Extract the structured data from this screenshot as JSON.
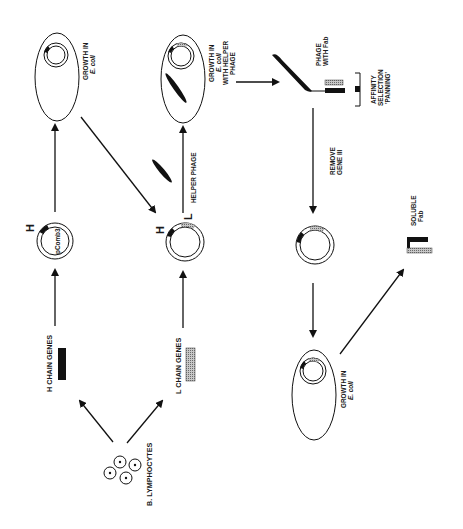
{
  "diagram": {
    "orientation": "rotated 90 degrees clockwise",
    "colors": {
      "ink": "#111111",
      "hatched": "#9a9a9a",
      "background": "#ffffff"
    },
    "labels": {
      "b_lymphocytes": "B. LYMPHOCYTES",
      "h_chain_genes": "H CHAIN GENES",
      "l_chain_genes": "L CHAIN GENES",
      "pcomb3": "pComb3",
      "h_marker_1": "H",
      "h_marker_2": "H",
      "l_marker": "L",
      "helper_phage": "HELPER PHAGE",
      "growth_ecoli_1_line1": "GROWTH IN",
      "growth_ecoli_1_line2": "E. coli",
      "growth_helper_line1": "GROWTH IN",
      "growth_helper_line2": "E. coli",
      "growth_helper_line3": "WITH HELPER",
      "growth_helper_line4": "PHAGE",
      "phage_with_fab_line1": "PHAGE",
      "phage_with_fab_line2": "WITH Fab",
      "affinity_line1": "AFFINITY",
      "affinity_line2": "SELECTION",
      "affinity_line3": "'PANNING'",
      "remove_gene_line1": "REMOVE",
      "remove_gene_line2": "GENE III",
      "growth_ecoli_2_line1": "GROWTH IN",
      "growth_ecoli_2_line2": "E. coli",
      "soluble_fab_line1": "SOLUBLE",
      "soluble_fab_line2": "Fab"
    },
    "nodes": [
      {
        "id": "b-lymphocytes",
        "label": "B. LYMPHOCYTES"
      },
      {
        "id": "h-chain-genes",
        "label": "H CHAIN GENES"
      },
      {
        "id": "l-chain-genes",
        "label": "L CHAIN GENES"
      },
      {
        "id": "pcomb3-h",
        "label": "pComb3 with H"
      },
      {
        "id": "ecoli-growth-1",
        "label": "GROWTH IN E. coli"
      },
      {
        "id": "pcomb3-hl",
        "label": "pComb3 with H and L"
      },
      {
        "id": "ecoli-helper",
        "label": "GROWTH IN E. coli WITH HELPER PHAGE"
      },
      {
        "id": "phage-fab",
        "label": "PHAGE WITH Fab"
      },
      {
        "id": "panning",
        "label": "AFFINITY SELECTION 'PANNING'"
      },
      {
        "id": "plasmid-no-geneIII",
        "label": "REMOVE GENE III"
      },
      {
        "id": "ecoli-growth-2",
        "label": "GROWTH IN E. coli"
      },
      {
        "id": "soluble-fab",
        "label": "SOLUBLE Fab"
      }
    ],
    "edges": [
      {
        "from": "b-lymphocytes",
        "to": "h-chain-genes"
      },
      {
        "from": "b-lymphocytes",
        "to": "l-chain-genes"
      },
      {
        "from": "h-chain-genes",
        "to": "pcomb3-h"
      },
      {
        "from": "pcomb3-h",
        "to": "ecoli-growth-1"
      },
      {
        "from": "ecoli-growth-1",
        "to": "pcomb3-hl"
      },
      {
        "from": "l-chain-genes",
        "to": "pcomb3-hl"
      },
      {
        "from": "pcomb3-hl",
        "to": "ecoli-helper",
        "label": "HELPER PHAGE"
      },
      {
        "from": "ecoli-helper",
        "to": "phage-fab"
      },
      {
        "from": "phage-fab",
        "to": "plasmid-no-geneIII",
        "label": "REMOVE GENE III"
      },
      {
        "from": "plasmid-no-geneIII",
        "to": "ecoli-growth-2"
      },
      {
        "from": "ecoli-growth-2",
        "to": "soluble-fab"
      }
    ]
  }
}
